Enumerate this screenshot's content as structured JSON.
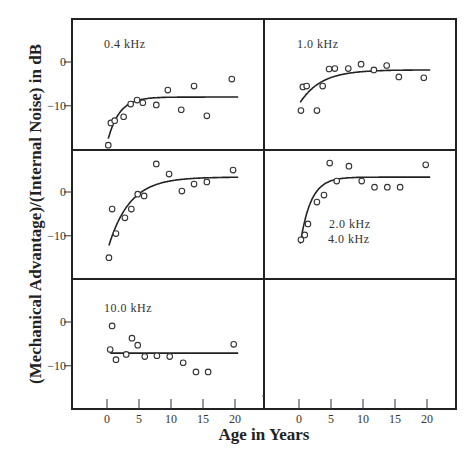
{
  "chart_data": {
    "type": "scatter",
    "title": "",
    "xlabel": "Age in Years",
    "ylabel": "(Mechanical Advantage)/(Internal Noise) in dB",
    "x_ticks": [
      0,
      5,
      10,
      15,
      20
    ],
    "y_ticks": [
      0,
      -10
    ],
    "y_tick_labels": [
      "0",
      "−10"
    ],
    "grid": false,
    "layout": "3 rows x 2 columns small multiples; bottom-right panel empty",
    "panels": [
      {
        "label": "0.4 kHz",
        "row": 0,
        "col": 0,
        "points": [
          [
            0.2,
            -19.0
          ],
          [
            0.6,
            -13.9
          ],
          [
            1.2,
            -13.4
          ],
          [
            2.6,
            -12.5
          ],
          [
            3.7,
            -9.6
          ],
          [
            4.7,
            -8.7
          ],
          [
            5.6,
            -9.3
          ],
          [
            7.7,
            -9.8
          ],
          [
            9.5,
            -6.4
          ],
          [
            11.6,
            -10.9
          ],
          [
            13.6,
            -5.5
          ],
          [
            15.6,
            -12.3
          ],
          [
            19.5,
            -3.9
          ]
        ],
        "fit": {
          "type": "exponential",
          "start": [
            0.2,
            -17.5
          ],
          "asymptote": -8.0,
          "rate": 0.55,
          "x_end": 20.5
        }
      },
      {
        "label": "1.0 kHz",
        "row": 0,
        "col": 1,
        "points": [
          [
            0.3,
            -11.1
          ],
          [
            0.6,
            -5.7
          ],
          [
            1.2,
            -5.5
          ],
          [
            2.8,
            -11.1
          ],
          [
            3.7,
            -5.5
          ],
          [
            4.7,
            -1.6
          ],
          [
            5.6,
            -1.5
          ],
          [
            7.7,
            -1.5
          ],
          [
            9.7,
            -0.5
          ],
          [
            11.7,
            -1.8
          ],
          [
            13.7,
            -0.8
          ],
          [
            15.6,
            -3.4
          ],
          [
            19.5,
            -3.6
          ]
        ],
        "fit": {
          "type": "exponential",
          "start": [
            0.2,
            -9.2
          ],
          "asymptote": -1.8,
          "rate": 0.3,
          "x_end": 20.5
        }
      },
      {
        "label": "2.0 kHz",
        "row": 1,
        "col": 0,
        "points": [
          [
            0.3,
            -15.0
          ],
          [
            0.8,
            -3.9
          ],
          [
            1.4,
            -9.5
          ],
          [
            2.8,
            -5.9
          ],
          [
            3.8,
            -3.9
          ],
          [
            4.8,
            -0.5
          ],
          [
            5.8,
            -0.9
          ],
          [
            7.7,
            6.4
          ],
          [
            9.7,
            4.1
          ],
          [
            11.7,
            0.2
          ],
          [
            13.6,
            1.8
          ],
          [
            15.6,
            2.3
          ],
          [
            19.7,
            5.0
          ]
        ],
        "fit": {
          "type": "exponential",
          "start": [
            0.3,
            -12.2
          ],
          "asymptote": 3.4,
          "rate": 0.3,
          "x_end": 20.5
        }
      },
      {
        "label": "4.0 kHz",
        "row": 1,
        "col": 1,
        "points": [
          [
            0.3,
            -10.9
          ],
          [
            0.9,
            -9.8
          ],
          [
            1.4,
            -7.3
          ],
          [
            2.8,
            -2.3
          ],
          [
            3.9,
            -0.7
          ],
          [
            4.8,
            6.6
          ],
          [
            5.9,
            2.5
          ],
          [
            7.8,
            5.9
          ],
          [
            9.8,
            2.5
          ],
          [
            11.8,
            1.1
          ],
          [
            13.8,
            1.1
          ],
          [
            15.8,
            1.1
          ],
          [
            19.8,
            6.2
          ]
        ],
        "fit": {
          "type": "exponential",
          "start": [
            0.2,
            -11.8
          ],
          "asymptote": 3.4,
          "rate": 0.6,
          "x_end": 20.5
        }
      },
      {
        "label": "10.0 kHz",
        "row": 2,
        "col": 0,
        "points": [
          [
            0.5,
            -6.3
          ],
          [
            0.8,
            -0.9
          ],
          [
            1.4,
            -8.6
          ],
          [
            3.0,
            -7.4
          ],
          [
            3.9,
            -3.7
          ],
          [
            4.8,
            -5.3
          ],
          [
            5.9,
            -7.9
          ],
          [
            7.8,
            -7.7
          ],
          [
            9.8,
            -7.9
          ],
          [
            11.9,
            -9.3
          ],
          [
            13.9,
            -11.4
          ],
          [
            15.8,
            -11.4
          ],
          [
            19.8,
            -5.1
          ]
        ],
        "fit": {
          "type": "constant",
          "value": -7.1,
          "x_start": 0.5,
          "x_end": 20.5
        }
      }
    ]
  },
  "layout": {
    "frame": {
      "left": 72,
      "top": 19,
      "right": 456,
      "bottom": 409
    },
    "col_split_x": 264,
    "row_splits_y": [
      150,
      279
    ],
    "x0_px": [
      107,
      299
    ],
    "px_per_year": 6.4,
    "zero_y_px": [
      62,
      192,
      322
    ],
    "px_per_db": 4.38,
    "panel_label_pos": [
      [
        104,
        48
      ],
      [
        297,
        48
      ],
      [
        329,
        228
      ],
      [
        328,
        243
      ],
      [
        104,
        312
      ]
    ],
    "stray_dot": [
      263,
      396
    ]
  }
}
